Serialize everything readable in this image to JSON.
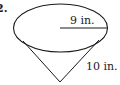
{
  "problem": {
    "number": "2."
  },
  "figure": {
    "shape": "cone",
    "radius_label": "9 in.",
    "slant_label": "10 in.",
    "stroke_color": "#1a1a1a",
    "background": "#ffffff"
  }
}
